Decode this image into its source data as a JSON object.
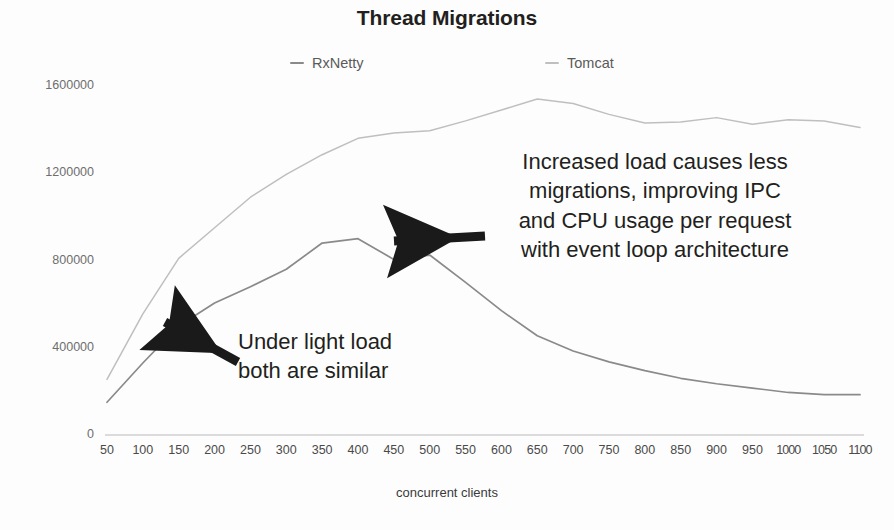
{
  "chart_data": {
    "type": "line",
    "title": "Thread Migrations",
    "xlabel": "concurrent clients",
    "ylabel": "",
    "grid": false,
    "legend_position": "top-center",
    "xlim": [
      50,
      1100
    ],
    "ylim": [
      0,
      1600000
    ],
    "xticks": [
      50,
      100,
      150,
      200,
      250,
      300,
      350,
      400,
      450,
      500,
      550,
      600,
      650,
      700,
      750,
      800,
      850,
      900,
      950,
      1000,
      1050,
      1100
    ],
    "xtick_labels": [
      "50",
      "100",
      "150",
      "200",
      "250",
      "300",
      "350",
      "400",
      "450",
      "500",
      "550",
      "600",
      "650",
      "700",
      "750",
      "800",
      "850",
      "900",
      "950",
      "1000",
      "1050",
      "1100"
    ],
    "yticks": [
      0,
      400000,
      800000,
      1200000,
      1600000
    ],
    "ytick_labels": [
      "0",
      "400000",
      "800000",
      "1200000",
      "1600000"
    ],
    "x": [
      50,
      100,
      150,
      200,
      250,
      300,
      350,
      400,
      450,
      500,
      550,
      600,
      650,
      700,
      750,
      800,
      850,
      900,
      950,
      1000,
      1050,
      1100
    ],
    "series": [
      {
        "name": "RxNetty",
        "color": "#8a8a8a",
        "values": [
          150000,
          330000,
          500000,
          605000,
          680000,
          760000,
          880000,
          900000,
          805000,
          825000,
          700000,
          570000,
          455000,
          385000,
          335000,
          295000,
          260000,
          235000,
          215000,
          195000,
          185000,
          185000
        ]
      },
      {
        "name": "Tomcat",
        "color": "#bfbfbf",
        "values": [
          255000,
          555000,
          810000,
          950000,
          1090000,
          1195000,
          1285000,
          1360000,
          1385000,
          1395000,
          1440000,
          1490000,
          1540000,
          1520000,
          1470000,
          1430000,
          1435000,
          1455000,
          1425000,
          1445000,
          1440000,
          1410000
        ]
      }
    ],
    "annotations": [
      {
        "id": "heavy-load",
        "lines": [
          "Increased load causes less",
          "migrations, improving IPC",
          "and CPU usage per request",
          "with event loop architecture"
        ],
        "arrow": {
          "from_x": 485,
          "from_y": 236,
          "to_x": 394,
          "to_y": 241
        }
      },
      {
        "id": "light-load",
        "lines": [
          "Under light load",
          "both are similar"
        ],
        "arrow": {
          "from_x": 238,
          "from_y": 362,
          "to_x": 165,
          "to_y": 322
        }
      }
    ]
  },
  "colors": {
    "background": "#fdfdfd",
    "text": "#231f20",
    "axis": "#b9b9b9",
    "rxnetty": "#8a8a8a",
    "tomcat": "#bfbfbf",
    "arrow": "#1a1a1a"
  }
}
